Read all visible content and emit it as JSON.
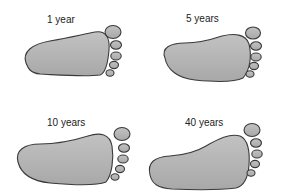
{
  "panels": [
    {
      "label": "1 year"
    },
    {
      "label": "5 years"
    },
    {
      "label": "10 years"
    },
    {
      "label": "40 years"
    }
  ],
  "colors": {
    "fill": "#b4b4b4",
    "stroke": "#3a3a3a",
    "background": "#ffffff"
  }
}
